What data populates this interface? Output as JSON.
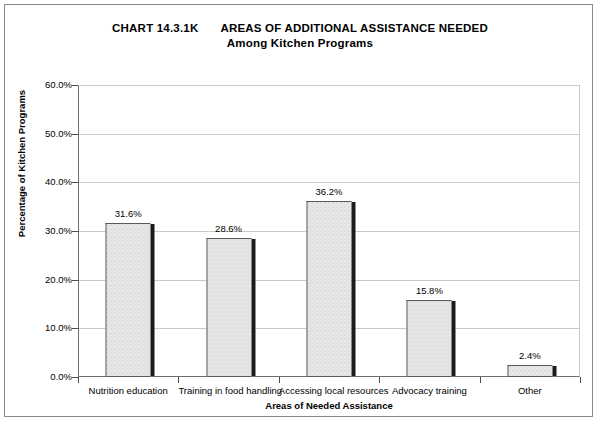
{
  "chart_data": {
    "type": "bar",
    "title_number": "CHART 14.3.1K",
    "title_main": "AREAS OF ADDITIONAL ASSISTANCE NEEDED",
    "subtitle": "Among Kitchen Programs",
    "xlabel": "Areas of Needed Assistance",
    "ylabel": "Percentage of Kitchen Programs",
    "categories": [
      "Nutrition education",
      "Training in food handling",
      "Accessing local resources",
      "Advocacy training",
      "Other"
    ],
    "values": [
      31.6,
      28.6,
      36.2,
      15.8,
      2.4
    ],
    "value_labels": [
      "31.6%",
      "28.6%",
      "36.2%",
      "15.8%",
      "2.4%"
    ],
    "ylim": [
      0,
      60
    ],
    "ytick_values": [
      0,
      10,
      20,
      30,
      40,
      50,
      60
    ],
    "ytick_labels": [
      "0.0%",
      "10.0%",
      "20.0%",
      "30.0%",
      "40.0%",
      "50.0%",
      "60.0%"
    ],
    "grid": "horizontal",
    "legend": "none",
    "colors": {
      "bar_fill": "#ebebeb",
      "bar_border": "#5a5a5a",
      "bar_shadow": "#1b1b1b",
      "gridline": "#c9c9c9",
      "axis": "#4d4d4d",
      "frame": "#8a8a8a",
      "background": "#ffffff",
      "text": "#000000"
    }
  }
}
